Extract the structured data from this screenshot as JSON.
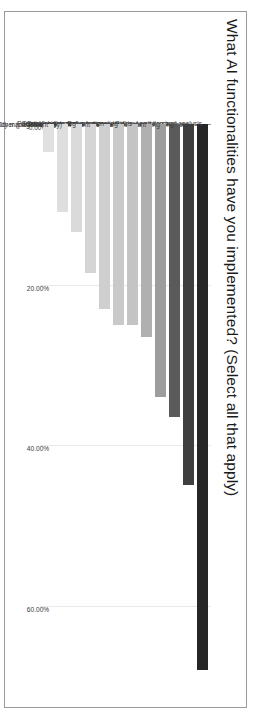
{
  "chart_data": {
    "type": "bar",
    "orientation": "vertical-rotated",
    "title": "What AI functionalities have you implemented? (Select all that apply)",
    "xlabel": "",
    "ylabel": "",
    "grid": true,
    "legend": null,
    "axis_ticks": [
      "0.00%",
      "20.00%",
      "40.00%",
      "60.00%"
    ],
    "axis_tick_values": [
      0,
      20,
      40,
      60
    ],
    "ylim": [
      0,
      70
    ],
    "categories": [
      "Call transcription and analysis",
      "Chatbots",
      "Lead scoring",
      "Automated lead routing",
      "Support AI Agent",
      "Deal insights and recommendations",
      "Sales forecasting",
      "Personalized content creation",
      "Prospecting AI Agent",
      "Territory balancing",
      "Other (please specify)",
      "CRM policy management"
    ],
    "values": [
      68.0,
      45.0,
      36.5,
      34.0,
      26.5,
      25.0,
      25.0,
      23.0,
      18.5,
      13.5,
      11.0,
      3.5
    ],
    "bar_colors": [
      "#262626",
      "#3f3f3f",
      "#5a5a5a",
      "#9d9d9d",
      "#b0b0b0",
      "#c4c4c4",
      "#c9c9c9",
      "#cfcfcf",
      "#d5d5d5",
      "#dadada",
      "#dedede",
      "#e0e0e0"
    ]
  },
  "frame": {
    "border_color": "#9a9a9a",
    "background": "#ffffff",
    "gridline_color": "#e9e9e9",
    "axis_color": "#8f8f8f"
  }
}
